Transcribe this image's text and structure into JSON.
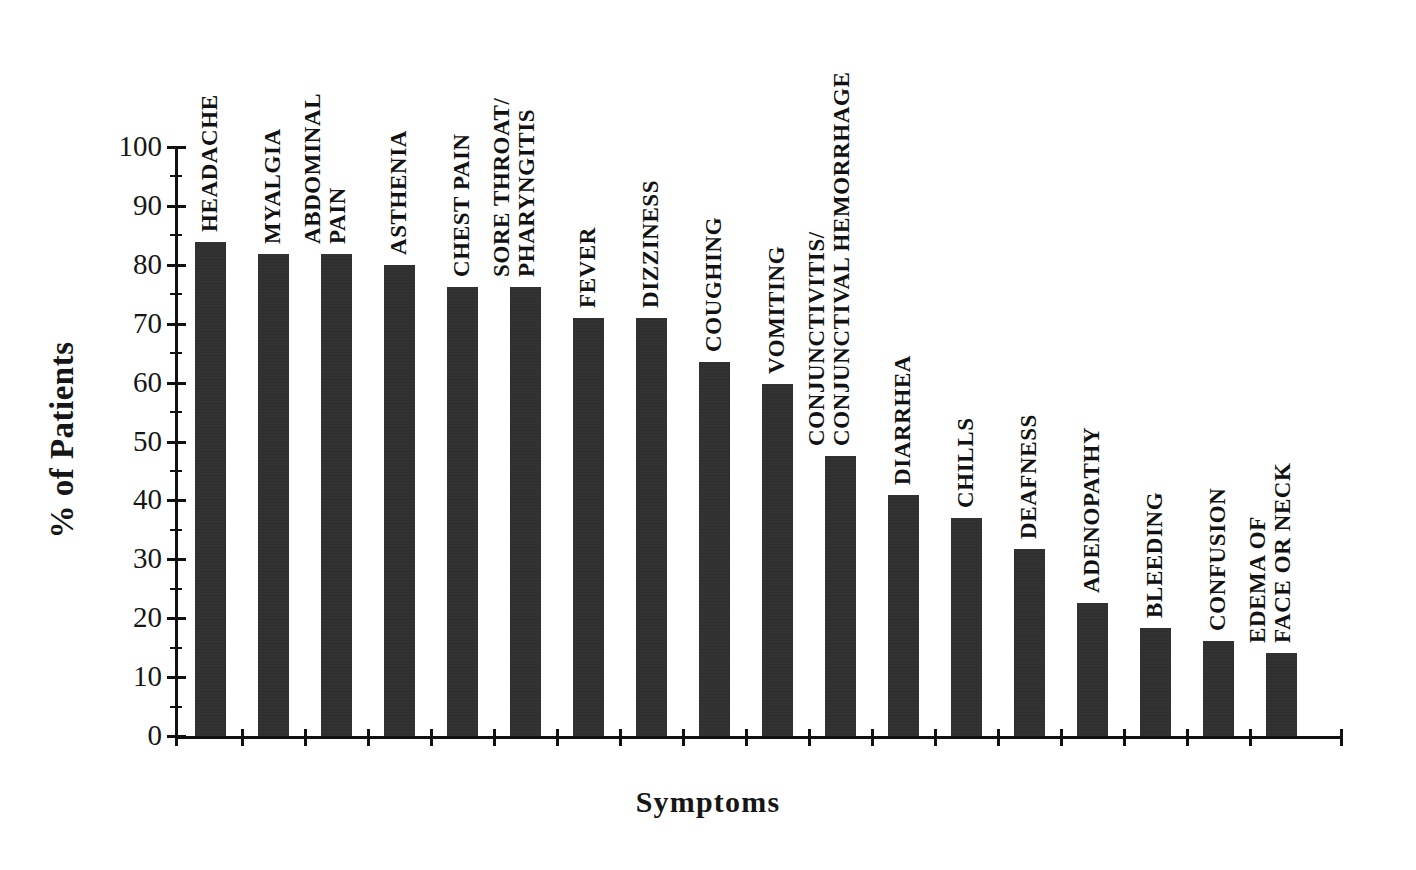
{
  "chart_data": {
    "type": "bar",
    "title": "",
    "xlabel": "Symptoms",
    "ylabel": "% of Patients",
    "ylim": [
      0,
      100
    ],
    "ytick_step": 10,
    "yticks": [
      0,
      10,
      20,
      30,
      40,
      50,
      60,
      70,
      80,
      90,
      100
    ],
    "ytick_labels": [
      "0",
      "10",
      "20",
      "30",
      "40",
      "50",
      "60",
      "70",
      "80",
      "90",
      "100"
    ],
    "minor_ticks": true,
    "grid": false,
    "legend": false,
    "bar_color": "#2b2b2b",
    "categories": [
      "HEADACHE",
      "MYALGIA",
      "ABDOMINAL PAIN",
      "ASTHENIA",
      "CHEST PAIN",
      "SORE THROAT/ PHARYNGITIS",
      "FEVER",
      "DIZZINESS",
      "COUGHING",
      "VOMITING",
      "CONJUNCTIVITIS/ CONJUNCTIVAL HEMORRHAGE",
      "DIARRHEA",
      "CHILLS",
      "DEAFNESS",
      "ADENOPATHY",
      "BLEEDING",
      "CONFUSION",
      "EDEMA OF FACE OR NECK"
    ],
    "values": [
      83.8,
      81.9,
      81.9,
      80.0,
      76.3,
      76.3,
      71.0,
      71.0,
      63.5,
      59.7,
      47.5,
      41.0,
      37.0,
      31.7,
      22.5,
      18.3,
      16.1,
      14.1
    ]
  },
  "bars": [
    {
      "label_line1": "HEADACHE",
      "label_line2": "",
      "value": 83.8
    },
    {
      "label_line1": "MYALGIA",
      "label_line2": "",
      "value": 81.9
    },
    {
      "label_line1": "ABDOMINAL",
      "label_line2": "PAIN",
      "value": 81.9
    },
    {
      "label_line1": "ASTHENIA",
      "label_line2": "",
      "value": 80.0
    },
    {
      "label_line1": "CHEST PAIN",
      "label_line2": "",
      "value": 76.3
    },
    {
      "label_line1": "SORE THROAT/",
      "label_line2": "PHARYNGITIS",
      "value": 76.3
    },
    {
      "label_line1": "FEVER",
      "label_line2": "",
      "value": 71.0
    },
    {
      "label_line1": "DIZZINESS",
      "label_line2": "",
      "value": 71.0
    },
    {
      "label_line1": "COUGHING",
      "label_line2": "",
      "value": 63.5
    },
    {
      "label_line1": "VOMITING",
      "label_line2": "",
      "value": 59.7
    },
    {
      "label_line1": "CONJUNCTIVITIS/",
      "label_line2": "CONJUNCTIVAL HEMORRHAGE",
      "value": 47.5
    },
    {
      "label_line1": "DIARRHEA",
      "label_line2": "",
      "value": 41.0
    },
    {
      "label_line1": "CHILLS",
      "label_line2": "",
      "value": 37.0
    },
    {
      "label_line1": "DEAFNESS",
      "label_line2": "",
      "value": 31.7
    },
    {
      "label_line1": "ADENOPATHY",
      "label_line2": "",
      "value": 22.5
    },
    {
      "label_line1": "BLEEDING",
      "label_line2": "",
      "value": 18.3
    },
    {
      "label_line1": "CONFUSION",
      "label_line2": "",
      "value": 16.1
    },
    {
      "label_line1": "EDEMA OF",
      "label_line2": "FACE OR NECK",
      "value": 14.1
    }
  ],
  "axes": {
    "y_title": "% of Patients",
    "x_title": "Symptoms",
    "y_tick_labels": [
      "100",
      "90",
      "80",
      "70",
      "60",
      "50",
      "40",
      "30",
      "20",
      "10",
      "0"
    ]
  }
}
